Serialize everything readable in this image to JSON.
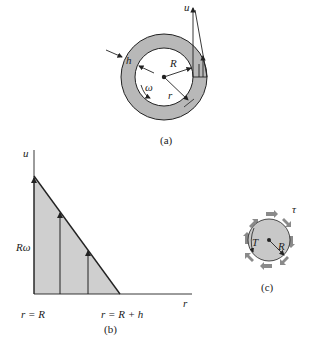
{
  "figure": {
    "panel_a": {
      "caption": "(a)",
      "labels": {
        "velocity": "u",
        "gap": "h",
        "inner_radius": "R",
        "angular_velocity": "ω",
        "radius": "r"
      },
      "colors": {
        "annulus_fill": "#b8b8b8",
        "stroke": "#222222"
      }
    },
    "panel_b": {
      "caption": "(b)",
      "labels": {
        "y_axis": "u",
        "x_axis": "r",
        "max_velocity": "Rω",
        "start": "r = R",
        "end": "r = R + h"
      },
      "colors": {
        "profile_fill": "#cfcfcf"
      }
    },
    "panel_c": {
      "caption": "(c)",
      "labels": {
        "torque": "T",
        "radius": "R",
        "shear_stress": "τ"
      },
      "colors": {
        "disk_fill": "#c8c8c8",
        "arrow_fill": "#8a8a8a"
      }
    }
  }
}
